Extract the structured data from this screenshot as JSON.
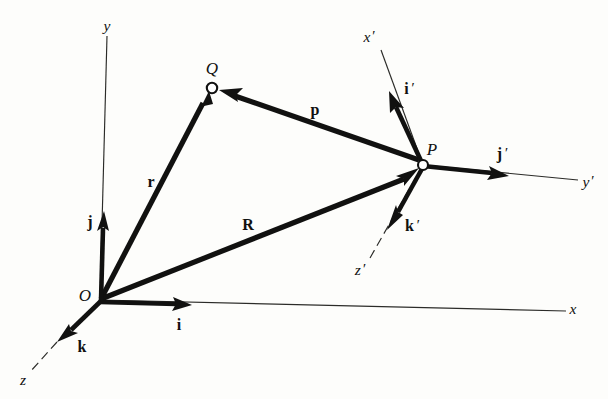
{
  "figure": {
    "background_color": "#fdfdfb",
    "ink_color": "#111110",
    "axis_color": "#2b2b28"
  },
  "points": [
    {
      "id": "O",
      "label": "O",
      "x": 100,
      "y": 300,
      "label_x": 85,
      "label_y": 297,
      "marker": "corner"
    },
    {
      "id": "Q",
      "label": "Q",
      "x": 212,
      "y": 88,
      "label_x": 212,
      "label_y": 70,
      "marker": "open-circle"
    },
    {
      "id": "P",
      "label": "P",
      "x": 423,
      "y": 165,
      "label_x": 432,
      "label_y": 151,
      "marker": "open-circle"
    }
  ],
  "axes": [
    {
      "id": "y",
      "label": "y",
      "label_x": 107,
      "label_y": 27,
      "style": "solid"
    },
    {
      "id": "x",
      "label": "x",
      "label_x": 573,
      "label_y": 310,
      "style": "solid"
    },
    {
      "id": "z",
      "label": "z",
      "label_x": 23,
      "label_y": 381,
      "style": "dashed"
    },
    {
      "id": "x-prime",
      "label": "x",
      "prime": "′",
      "label_x": 369,
      "label_y": 38,
      "style": "solid"
    },
    {
      "id": "y-prime",
      "label": "y",
      "prime": "′",
      "label_x": 588,
      "label_y": 183,
      "style": "solid"
    },
    {
      "id": "z-prime",
      "label": "z",
      "prime": "′",
      "label_x": 360,
      "label_y": 271,
      "style": "dashed"
    }
  ],
  "vectors": [
    {
      "id": "r",
      "label": "r",
      "from": "O",
      "to": "Q",
      "label_x": 151,
      "label_y": 183,
      "kind": "position"
    },
    {
      "id": "R",
      "label": "R",
      "from": "O",
      "to": "P",
      "label_x": 248,
      "label_y": 226,
      "kind": "position"
    },
    {
      "id": "p",
      "label": "p",
      "from": "P",
      "to": "Q",
      "label_x": 315,
      "label_y": 111,
      "kind": "relative"
    }
  ],
  "unit_vectors": [
    {
      "id": "i",
      "label": "i",
      "frame": "O",
      "label_x": 179,
      "label_y": 326
    },
    {
      "id": "j",
      "label": "j",
      "frame": "O",
      "label_x": 90,
      "label_y": 223
    },
    {
      "id": "k",
      "label": "k",
      "frame": "O",
      "label_x": 82,
      "label_y": 348
    },
    {
      "id": "i-prime",
      "label": "i",
      "prime": "′",
      "frame": "P",
      "label_x": 409,
      "label_y": 90
    },
    {
      "id": "j-prime",
      "label": "j",
      "prime": "′",
      "frame": "P",
      "label_x": 502,
      "label_y": 155
    },
    {
      "id": "k-prime",
      "label": "k",
      "prime": "′",
      "frame": "P",
      "label_x": 412,
      "label_y": 227
    }
  ]
}
